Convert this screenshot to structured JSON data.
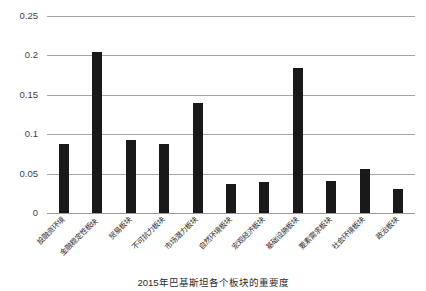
{
  "chart_data": {
    "type": "bar",
    "title": "",
    "caption": "2015年巴基斯坦各个板块的重要度",
    "xlabel": "",
    "ylabel": "",
    "ylim": [
      0,
      0.25
    ],
    "ytick_labels": [
      "0",
      "0.05",
      "0.1",
      "0.15",
      "0.2",
      "0.25"
    ],
    "ytick_values": [
      0,
      0.05,
      0.1,
      0.15,
      0.2,
      0.25
    ],
    "grid": true,
    "legend": "none",
    "bar_color": "#191919",
    "categories": [
      "投融资环境",
      "金融稳定性板块",
      "贸易板块",
      "不可抗力板块",
      "市场潜力板块",
      "自然环境板块",
      "宏观经济板块",
      "基础设施板块",
      "要素需求板块",
      "社会环境板块",
      "政治板块"
    ],
    "values": [
      0.088,
      0.204,
      0.093,
      0.088,
      0.14,
      0.037,
      0.039,
      0.184,
      0.041,
      0.056,
      0.031
    ]
  }
}
